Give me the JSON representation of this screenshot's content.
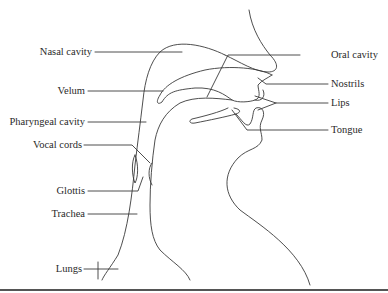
{
  "figure": {
    "type": "anatomical-diagram",
    "labels_left": [
      {
        "id": "nasal-cavity",
        "text": "Nasal cavity"
      },
      {
        "id": "velum",
        "text": "Velum"
      },
      {
        "id": "pharyngeal-cavity",
        "text": "Pharyngeal cavity"
      },
      {
        "id": "vocal-cords",
        "text": "Vocal cords"
      },
      {
        "id": "glottis",
        "text": "Glottis"
      },
      {
        "id": "trachea",
        "text": "Trachea"
      },
      {
        "id": "lungs",
        "text": "Lungs"
      }
    ],
    "labels_right": [
      {
        "id": "oral-cavity",
        "text": "Oral cavity"
      },
      {
        "id": "nostrils",
        "text": "Nostrils"
      },
      {
        "id": "lips",
        "text": "Lips"
      },
      {
        "id": "tongue",
        "text": "Tongue"
      }
    ],
    "colors": {
      "line": "#3a3a3a",
      "text": "#2a2a2a",
      "background": "#ffffff"
    }
  }
}
